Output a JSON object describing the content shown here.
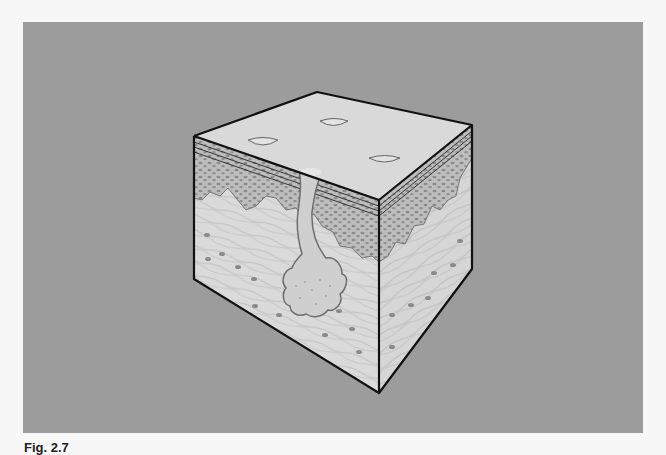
{
  "figure": {
    "caption_label": "Fig. 2.7",
    "caption_text": "",
    "layers": [
      "stratum corneum",
      "epidermis",
      "dermis",
      "hair follicle"
    ],
    "colors": {
      "page_background": "#f7f7f7",
      "frame_background": "#9c9c9c",
      "top_surface": "#d9d9d9",
      "epidermis": "#bdbdbd",
      "epidermis_cells": "#8a8a8a",
      "dermis": "#dadada",
      "dermis_fibers": "#b0b0b0",
      "outline": "#111111"
    }
  }
}
